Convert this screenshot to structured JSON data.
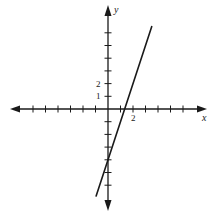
{
  "chart_data": {
    "type": "line",
    "title": "",
    "xlabel": "x",
    "ylabel": "y",
    "xlim": [
      -8,
      8
    ],
    "ylim": [
      -8,
      8
    ],
    "grid": false,
    "x_ticks_labeled": [
      {
        "value": 2,
        "label": "2"
      }
    ],
    "y_ticks_labeled": [
      {
        "value": 1,
        "label": "1"
      },
      {
        "value": 2,
        "label": "2"
      }
    ],
    "x_tick_values": [
      -6,
      -5,
      -4,
      -3,
      -2,
      -1,
      1,
      2,
      3,
      4,
      5,
      6
    ],
    "y_tick_values": [
      -6,
      -5,
      -4,
      -3,
      -2,
      -1,
      1,
      2,
      3,
      4,
      5,
      6
    ],
    "series": [
      {
        "name": "line",
        "equation": "y = 3x - 4",
        "x": [
          -0.95,
          3.5
        ],
        "y": [
          -6.85,
          6.5
        ],
        "color": "#1a1a1a"
      }
    ],
    "annotations": [
      "x-intercept ≈ 4/3",
      "y-intercept = -4"
    ]
  },
  "axes": {
    "x_label": "x",
    "y_label": "y",
    "x_tick_label_2": "2",
    "y_tick_label_1": "1",
    "y_tick_label_2": "2"
  },
  "colors": {
    "ink": "#1a1a1a",
    "background": "#ffffff"
  }
}
